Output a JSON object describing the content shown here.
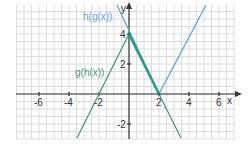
{
  "chart_data": {
    "type": "line",
    "title": "",
    "xlabel": "x",
    "ylabel": "y",
    "xlim": [
      -7.5,
      7
    ],
    "ylim": [
      -3,
      6
    ],
    "grid": true,
    "grid_step": 0.5,
    "x_ticks": [
      -6,
      -4,
      -2,
      2,
      4,
      6
    ],
    "x_tick_labels": [
      "-6",
      "-4",
      "-2",
      "2",
      "4",
      "6"
    ],
    "y_ticks": [
      -2,
      2,
      4
    ],
    "y_tick_labels": [
      "-2",
      "2",
      "4"
    ],
    "series": [
      {
        "name": "h(g(x))",
        "color": "#5aa9d6",
        "formula": "y = |2x - 4|",
        "points": [
          [
            -0.97,
            5.93
          ],
          [
            2,
            0
          ],
          [
            4.97,
            5.93
          ]
        ]
      },
      {
        "name": "g(h(x))",
        "color": "#4a9a7a",
        "formula": "y = -2|x| + 4",
        "points": [
          [
            -3.47,
            -2.93
          ],
          [
            0,
            4
          ],
          [
            3.47,
            -2.93
          ]
        ]
      }
    ],
    "annotations": [
      {
        "text": "h(g(x))",
        "near": [
          -0.97,
          5.0
        ]
      },
      {
        "text": "g(h(x))",
        "near": [
          -2.3,
          1.5
        ]
      }
    ],
    "overlap_segment": {
      "from": [
        0,
        4
      ],
      "to": [
        2,
        0
      ],
      "color": "#2a9a8a"
    }
  },
  "labels": {
    "x_axis": "x",
    "y_axis": "y",
    "hg": "h(g(x))",
    "gh": "g(h(x))",
    "xt_m6": "-6",
    "xt_m4": "-4",
    "xt_m2": "-2",
    "xt_2": "2",
    "xt_4": "4",
    "xt_6": "6",
    "yt_4": "4",
    "yt_2": "2",
    "yt_m2": "-2"
  },
  "colors": {
    "hg": "#5aa9d6",
    "gh": "#4a9a7a",
    "overlap": "#2a9a8a",
    "grid": "#dcdcdc",
    "axis": "#333333"
  }
}
